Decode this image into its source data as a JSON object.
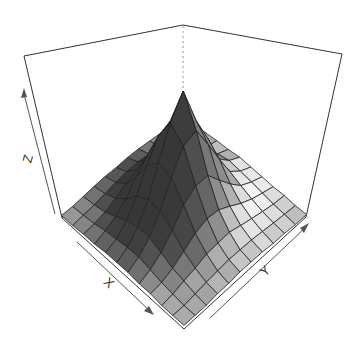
{
  "chart_data": {
    "type": "surface3d",
    "title": "",
    "xlabel": "X",
    "ylabel": "Y",
    "zlabel": "Z",
    "grid_size": [
      12,
      12
    ],
    "z_values": [
      [
        0.02,
        0.03,
        0.04,
        0.05,
        0.05,
        0.06,
        0.05,
        0.04,
        0.03,
        0.03,
        0.02,
        0.02
      ],
      [
        0.03,
        0.04,
        0.06,
        0.08,
        0.1,
        0.12,
        0.1,
        0.08,
        0.06,
        0.04,
        0.03,
        0.02
      ],
      [
        0.04,
        0.06,
        0.09,
        0.14,
        0.2,
        0.22,
        0.18,
        0.13,
        0.09,
        0.06,
        0.04,
        0.03
      ],
      [
        0.05,
        0.08,
        0.14,
        0.24,
        0.4,
        0.48,
        0.36,
        0.22,
        0.13,
        0.08,
        0.05,
        0.03
      ],
      [
        0.06,
        0.1,
        0.2,
        0.38,
        0.62,
        0.7,
        0.55,
        0.32,
        0.18,
        0.1,
        0.06,
        0.04
      ],
      [
        0.06,
        0.11,
        0.22,
        0.45,
        0.7,
        1.0,
        0.72,
        0.42,
        0.22,
        0.12,
        0.06,
        0.04
      ],
      [
        0.05,
        0.1,
        0.2,
        0.4,
        0.62,
        0.78,
        0.65,
        0.4,
        0.22,
        0.11,
        0.06,
        0.04
      ],
      [
        0.05,
        0.08,
        0.15,
        0.28,
        0.44,
        0.52,
        0.46,
        0.32,
        0.18,
        0.1,
        0.05,
        0.03
      ],
      [
        0.04,
        0.06,
        0.1,
        0.17,
        0.26,
        0.3,
        0.28,
        0.2,
        0.12,
        0.07,
        0.04,
        0.03
      ],
      [
        0.03,
        0.04,
        0.06,
        0.1,
        0.14,
        0.16,
        0.15,
        0.11,
        0.07,
        0.05,
        0.03,
        0.02
      ],
      [
        0.02,
        0.03,
        0.04,
        0.06,
        0.07,
        0.08,
        0.08,
        0.06,
        0.04,
        0.03,
        0.02,
        0.02
      ],
      [
        0.02,
        0.02,
        0.03,
        0.03,
        0.04,
        0.04,
        0.04,
        0.03,
        0.03,
        0.02,
        0.02,
        0.02
      ]
    ],
    "zlim": [
      0,
      1.3
    ],
    "box": true,
    "shade": true,
    "colors": {
      "box_line": "#333333",
      "hidden_line": "#999999",
      "mesh_line": "#222222",
      "arrow": "#555555"
    }
  }
}
